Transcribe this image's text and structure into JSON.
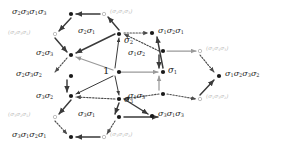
{
  "figure": {
    "type": "cayley-graph",
    "width": 282,
    "height": 150,
    "background": "#ffffff",
    "colors": {
      "node_solid": "#1a1a1a",
      "node_ghost": "#b8b8b8",
      "edge_dark": "#3a3a3a",
      "edge_gray": "#9a9a9a",
      "edge_dotted": "#4a4a4a",
      "label_main": "#1a1a1a",
      "label_ghost": "#bdbdbd"
    },
    "generators": [
      "σ₁",
      "σ₂",
      "σ₃"
    ]
  },
  "nodes": [
    {
      "id": "n_identity",
      "x": 119,
      "y": 72,
      "kind": "solid",
      "label": "1",
      "lx": 103,
      "ly": 66,
      "size": "one",
      "ghost": false
    },
    {
      "id": "n_s2",
      "x": 119,
      "y": 34,
      "kind": "solid",
      "label": "σ₂",
      "lx": 124,
      "ly": 36,
      "size": "l9",
      "ghost": false
    },
    {
      "id": "n_s3",
      "x": 119,
      "y": 99,
      "kind": "solid",
      "label": "σ₃",
      "lx": 124,
      "ly": 95,
      "size": "l9",
      "ghost": false
    },
    {
      "id": "n_s1",
      "x": 163,
      "y": 72,
      "kind": "solid",
      "label": "σ₁",
      "lx": 168,
      "ly": 66,
      "size": "l9",
      "ghost": false
    },
    {
      "id": "n_s2s1",
      "x": 119,
      "y": 34,
      "kind": "none",
      "label": "σ₂σ₁",
      "lx": 78,
      "ly": 27,
      "size": "l8",
      "ghost": false
    },
    {
      "id": "n_s2s3",
      "x": 71,
      "y": 55,
      "kind": "solid",
      "label": "σ₂σ₃",
      "lx": 36,
      "ly": 49,
      "size": "l8",
      "ghost": false
    },
    {
      "id": "n_s3s2",
      "x": 71,
      "y": 96,
      "kind": "solid",
      "label": "σ₃σ₂",
      "lx": 36,
      "ly": 92,
      "size": "l8",
      "ghost": false
    },
    {
      "id": "n_s3s1",
      "x": 119,
      "y": 117,
      "kind": "solid",
      "label": "σ₃σ₁",
      "lx": 78,
      "ly": 110,
      "size": "l8",
      "ghost": false
    },
    {
      "id": "n_s1s2",
      "x": 163,
      "y": 51,
      "kind": "solid",
      "label": "σ₁σ₂",
      "lx": 128,
      "ly": 49,
      "size": "l8",
      "ghost": false
    },
    {
      "id": "n_s1s3",
      "x": 163,
      "y": 94,
      "kind": "solid",
      "label": "σ₁σ₃",
      "lx": 128,
      "ly": 92,
      "size": "l8",
      "ghost": false
    },
    {
      "id": "n_s2s1_node",
      "x": 119,
      "y": 34,
      "kind": "none",
      "label": "",
      "lx": 0,
      "ly": 0,
      "size": "l8",
      "ghost": false
    },
    {
      "id": "n_s1s2s1",
      "x": 152,
      "y": 33,
      "kind": "solid",
      "label": "σ₁σ₂σ₁",
      "lx": 158,
      "ly": 27,
      "size": "l8",
      "ghost": false
    },
    {
      "id": "n_s3s1s3",
      "x": 152,
      "y": 116,
      "kind": "solid",
      "label": "σ₃σ₁σ₃",
      "lx": 158,
      "ly": 110,
      "size": "l8",
      "ghost": false
    },
    {
      "id": "n_s2s3s2",
      "x": 71,
      "y": 76,
      "kind": "solid",
      "label": "σ₂σ₃σ₂",
      "lx": 16,
      "ly": 70,
      "size": "l8",
      "ghost": false
    },
    {
      "id": "n_s2s3s1s3",
      "x": 71,
      "y": 14,
      "kind": "solid",
      "label": "σ₂σ₃σ₁σ₃",
      "lx": 12,
      "ly": 8,
      "size": "l8",
      "ghost": false
    },
    {
      "id": "n_s3s1s2s1",
      "x": 71,
      "y": 137,
      "kind": "solid",
      "label": "σ₃σ₁σ₂σ₁",
      "lx": 12,
      "ly": 131,
      "size": "l8",
      "ghost": false
    },
    {
      "id": "n_s1s2s3s2",
      "x": 219,
      "y": 76,
      "kind": "solid",
      "label": "σ₁σ₂σ₃σ₂",
      "lx": 225,
      "ly": 70,
      "size": "l8",
      "ghost": false
    },
    {
      "id": "g_top",
      "x": 104,
      "y": 14,
      "kind": "ghost",
      "label": "(σ₂σ₁σ₃)",
      "lx": 110,
      "ly": 9,
      "size": "l6",
      "ghost": true
    },
    {
      "id": "g_left_upper",
      "x": 55,
      "y": 34,
      "kind": "ghost",
      "label": "(σ₂σ₃σ₁)",
      "lx": 8,
      "ly": 30,
      "size": "l6",
      "ghost": true
    },
    {
      "id": "g_left_lower",
      "x": 55,
      "y": 117,
      "kind": "ghost",
      "label": "(σ₃σ₂σ₁)",
      "lx": 8,
      "ly": 112,
      "size": "l6",
      "ghost": true
    },
    {
      "id": "g_bottom",
      "x": 104,
      "y": 137,
      "kind": "ghost",
      "label": "(σ₃σ₁σ₂)",
      "lx": 110,
      "ly": 132,
      "size": "l6",
      "ghost": true
    },
    {
      "id": "g_right_upper",
      "x": 200,
      "y": 51,
      "kind": "ghost",
      "label": "(σ₁σ₄σ₃)",
      "lx": 206,
      "ly": 46,
      "size": "l6",
      "ghost": true
    },
    {
      "id": "g_right_lower",
      "x": 200,
      "y": 99,
      "kind": "ghost",
      "label": "(σ₁σ₃σ₂)",
      "lx": 206,
      "ly": 94,
      "size": "l6",
      "ghost": true
    }
  ],
  "edges": [
    {
      "from": [
        119,
        72
      ],
      "to": [
        158,
        72
      ],
      "style": "gray-solid",
      "arrow": true,
      "name": "edge-identity-to-s1"
    },
    {
      "from": [
        115,
        68
      ],
      "to": [
        119,
        38
      ],
      "style": "dark-thin",
      "arrow": true,
      "name": "edge-identity-to-s2"
    },
    {
      "from": [
        115,
        76
      ],
      "to": [
        119,
        95
      ],
      "style": "dark-thin",
      "arrow": true,
      "name": "edge-identity-to-s3"
    },
    {
      "from": [
        113,
        70
      ],
      "to": [
        76,
        57
      ],
      "style": "gray-solid",
      "arrow": true,
      "name": "edge-identity-to-s2s3"
    },
    {
      "from": [
        113,
        76
      ],
      "to": [
        76,
        94
      ],
      "style": "dark-thin",
      "arrow": true,
      "name": "edge-identity-to-s3s2"
    },
    {
      "from": [
        124,
        33
      ],
      "to": [
        148,
        33
      ],
      "style": "dotted",
      "arrow": true,
      "name": "edge-s2s1-to-s1s2s1"
    },
    {
      "from": [
        119,
        30
      ],
      "to": [
        108,
        17
      ],
      "style": "dark-solid",
      "arrow": true,
      "name": "edge-s2s1-to-top-ghost"
    },
    {
      "from": [
        115,
        34
      ],
      "to": [
        76,
        53
      ],
      "style": "dark-solid",
      "arrow": true,
      "name": "edge-s2-to-s2s3"
    },
    {
      "from": [
        124,
        99
      ],
      "to": [
        148,
        114
      ],
      "style": "dark-solid",
      "arrow": true,
      "name": "edge-s3-to-s3s1s3"
    },
    {
      "from": [
        115,
        99
      ],
      "to": [
        76,
        97
      ],
      "style": "dotted",
      "arrow": true,
      "name": "edge-s3-to-s3s2"
    },
    {
      "from": [
        119,
        103
      ],
      "to": [
        115,
        114
      ],
      "style": "dark-solid",
      "arrow": true,
      "name": "edge-s3-to-s3s1"
    },
    {
      "from": [
        163,
        68
      ],
      "to": [
        157,
        37
      ],
      "style": "dark-solid",
      "arrow": true,
      "name": "edge-s1-to-s1s2s1"
    },
    {
      "from": [
        167,
        51
      ],
      "to": [
        196,
        51
      ],
      "style": "gray-solid",
      "arrow": true,
      "name": "edge-s1s2-to-right-upper-ghost"
    },
    {
      "from": [
        159,
        51
      ],
      "to": [
        124,
        34
      ],
      "style": "dotted",
      "arrow": true,
      "name": "edge-s1s2-to-s2"
    },
    {
      "from": [
        159,
        55
      ],
      "to": [
        159,
        68
      ],
      "style": "dark-solid",
      "arrow": true,
      "name": "edge-s1s2-to-s1"
    },
    {
      "from": [
        167,
        94
      ],
      "to": [
        196,
        99
      ],
      "style": "dotted",
      "arrow": true,
      "name": "edge-s1s3-to-right-lower-ghost"
    },
    {
      "from": [
        159,
        90
      ],
      "to": [
        159,
        76
      ],
      "style": "gray-solid",
      "arrow": true,
      "name": "edge-s1s3-to-s1"
    },
    {
      "from": [
        159,
        94
      ],
      "to": [
        124,
        99
      ],
      "style": "dotted",
      "arrow": true,
      "name": "edge-s1s3-to-s3"
    },
    {
      "from": [
        100,
        14
      ],
      "to": [
        76,
        14
      ],
      "style": "dark-solid",
      "arrow": true,
      "name": "edge-top-ghost-to-s2s3s1s3"
    },
    {
      "from": [
        71,
        18
      ],
      "to": [
        59,
        31
      ],
      "style": "dark-solid",
      "arrow": true,
      "name": "edge-s2s3s1s3-to-left-upper-ghost"
    },
    {
      "from": [
        55,
        38
      ],
      "to": [
        67,
        52
      ],
      "style": "dark-solid",
      "arrow": true,
      "name": "edge-left-upper-ghost-to-s2s3"
    },
    {
      "from": [
        67,
        58
      ],
      "to": [
        55,
        72
      ],
      "style": "dotted",
      "arrow": true,
      "name": "edge-s2s3-to-s2s3s2"
    },
    {
      "from": [
        67,
        80
      ],
      "to": [
        67,
        92
      ],
      "style": "dark-solid",
      "arrow": true,
      "name": "edge-s2s3s2-to-s3s2"
    },
    {
      "from": [
        71,
        100
      ],
      "to": [
        59,
        114
      ],
      "style": "dark-solid",
      "arrow": true,
      "name": "edge-s3s2-to-left-lower-ghost"
    },
    {
      "from": [
        55,
        121
      ],
      "to": [
        67,
        134
      ],
      "style": "dotted",
      "arrow": true,
      "name": "edge-left-lower-ghost-to-s3s1s2s1"
    },
    {
      "from": [
        100,
        137
      ],
      "to": [
        76,
        137
      ],
      "style": "dark-solid",
      "arrow": true,
      "name": "edge-bottom-ghost-to-s3s1s2s1"
    },
    {
      "from": [
        115,
        121
      ],
      "to": [
        107,
        134
      ],
      "style": "dotted",
      "arrow": true,
      "name": "edge-s3s1-to-bottom-ghost"
    },
    {
      "from": [
        124,
        117
      ],
      "to": [
        158,
        117
      ],
      "style": "dark-solid",
      "arrow": true,
      "name": "edge-s3s1-to-s3s1s3"
    },
    {
      "from": [
        200,
        55
      ],
      "to": [
        214,
        72
      ],
      "style": "dotted",
      "arrow": true,
      "name": "edge-right-upper-ghost-to-s1s2s3s2"
    },
    {
      "from": [
        200,
        95
      ],
      "to": [
        214,
        80
      ],
      "style": "dark-solid",
      "arrow": true,
      "name": "edge-right-lower-ghost-to-s1s2s3s2"
    }
  ]
}
